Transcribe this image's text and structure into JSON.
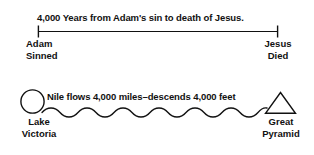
{
  "figure": {
    "background": "#ffffff",
    "ink": "#111111",
    "panels": [
      {
        "id": "timeline-panel",
        "caption": "4,000 Years from Adam's sin to death of Jesus.",
        "left_marker": {
          "icon": "tick-mark-icon",
          "line1": "Adam",
          "line2": "Sinned"
        },
        "right_marker": {
          "icon": "tick-mark-icon",
          "line1": "Jesus",
          "line2": "Died"
        }
      },
      {
        "id": "nile-panel",
        "caption": "Nile flows 4,000 miles–descends 4,000 feet",
        "left_marker": {
          "icon": "circle-icon",
          "line1": "Lake",
          "line2": "Victoria"
        },
        "right_marker": {
          "icon": "triangle-icon",
          "line1": "Great",
          "line2": "Pyramid"
        }
      }
    ]
  }
}
